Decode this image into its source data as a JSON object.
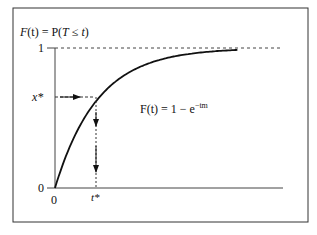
{
  "figure": {
    "y_axis_title": "F(t) = P(T ≤ t)",
    "y_axis_title_parts": {
      "lhs": "F",
      "arg": "(t)",
      "eq": " = P(",
      "T": "T",
      "le": " ≤ ",
      "t": "t",
      "close": ")"
    },
    "formula": {
      "lhs": "F(t) = 1 − e",
      "exponent": "−tm"
    },
    "y_ticks": [
      "1",
      "x*",
      "0"
    ],
    "x_ticks": [
      "0",
      "t*"
    ],
    "curve": "cumulative distribution function, exponential: F(t) = 1 - e^(-tm)",
    "x_star_level": 0.64,
    "t_star": 0.19,
    "asymptote": 1
  }
}
